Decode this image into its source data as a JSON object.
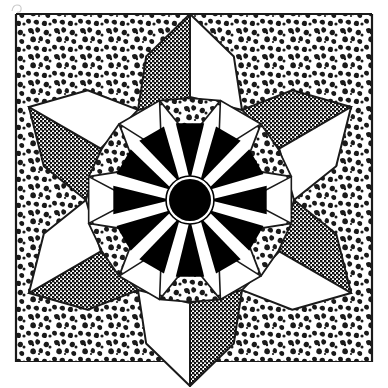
{
  "artwork": {
    "title": "Six-Pointed Star Rosette",
    "medium": "line-art halftone illustration",
    "canvas": {
      "width": 388,
      "height": 388,
      "background": "#ffffff"
    },
    "frame": {
      "name": "partial-rectangular-border",
      "left_x": 16,
      "right_x": 372,
      "top_y": 14,
      "bottom_y": 362,
      "stroke": "#1a1a1a",
      "stroke_width": 2.2
    },
    "center": {
      "x": 190,
      "y": 200
    },
    "hub": {
      "name": "central-black-disc",
      "radius": 21,
      "ring_radius": 24,
      "fill": "#000000",
      "ring_stroke": "#000000"
    },
    "sunburst": {
      "ray_count": 12,
      "inner_radius": 23,
      "outer_radius": 78,
      "ray_fill": "#000000",
      "gap_fill": "#ffffff",
      "start_angle_deg": -90
    },
    "inner_kites": {
      "count": 6,
      "texture": "coarse-speckle",
      "fill_pattern": "speckle-coarse",
      "inner_radius": 62,
      "outer_radius": 104
    },
    "star_points": {
      "count": 6,
      "tip_radius": 186,
      "waist_radius": 104,
      "shoulder_radius": 150,
      "left_half_texture": "halftone-gray",
      "right_half_texture": "white",
      "stroke": "#1a1a1a"
    },
    "background_fill": {
      "name": "corner-speckle-field",
      "texture": "speckle-coarse",
      "description": "coarse stipple filling the frame corners outside the star"
    },
    "palette": {
      "ink": "#1a1a1a",
      "black": "#000000",
      "white": "#ffffff",
      "halftone_gray": "#6e6e6e",
      "speckle_gray": "#3a3a3a"
    },
    "artifact_mark": {
      "name": "scan-artifact-glyph",
      "x": 12,
      "y": 2,
      "width": 12,
      "height": 9
    }
  }
}
